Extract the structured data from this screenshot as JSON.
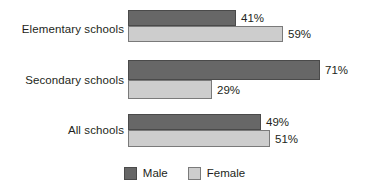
{
  "chart_data": {
    "type": "bar",
    "orientation": "horizontal",
    "title": "",
    "subtitle": "",
    "xlabel": "",
    "ylabel": "",
    "xlim": [
      0,
      100
    ],
    "grid": false,
    "legend_position": "bottom-center",
    "categories": [
      "Elementary schools",
      "Secondary schools",
      "All schools"
    ],
    "series": [
      {
        "name": "Male",
        "values": [
          41,
          71,
          49
        ],
        "color": "#676767"
      },
      {
        "name": "Female",
        "values": [
          59,
          29,
          51
        ],
        "color": "#cdcdcd"
      }
    ],
    "data_labels": [
      {
        "category": "Elementary schools",
        "male": "41%",
        "female": "59%"
      },
      {
        "category": "Secondary schools",
        "male": "71%",
        "female": "29%"
      },
      {
        "category": "All schools",
        "male": "49%",
        "female": "51%"
      }
    ]
  },
  "groups": [
    {
      "label": "Elementary schools",
      "male": {
        "label": "41%",
        "width_px": 108
      },
      "female": {
        "label": "59%",
        "width_px": 155
      }
    },
    {
      "label": "Secondary schools",
      "male": {
        "label": "71%",
        "width_px": 192
      },
      "female": {
        "label": "29%",
        "width_px": 84
      }
    },
    {
      "label": "All schools",
      "male": {
        "label": "49%",
        "width_px": 133
      },
      "female": {
        "label": "51%",
        "width_px": 142
      }
    }
  ],
  "legend": {
    "items": [
      {
        "label": "Male",
        "color": "#676767"
      },
      {
        "label": "Female",
        "color": "#cdcdcd"
      }
    ]
  },
  "colors": {
    "male": "#676767",
    "female": "#cdcdcd",
    "text": "#231f20",
    "background": "#ffffff",
    "bar_outline": "#58595b"
  }
}
